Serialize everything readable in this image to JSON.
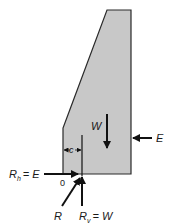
{
  "diagram": {
    "type": "gravity-wall-free-body",
    "colors": {
      "wall_fill": "#c8c8c8",
      "outline": "#2a2a2a",
      "arrow": "#111111",
      "background": "#ffffff"
    },
    "labels": {
      "weight": "W",
      "earth_pressure": "E",
      "eccentricity": "c",
      "origin": "0",
      "resultant": "R",
      "horizontal_reaction_main": "R",
      "horizontal_reaction_sub": "h",
      "horizontal_reaction_eq": "= E",
      "vertical_reaction_main": "R",
      "vertical_reaction_sub": "v",
      "vertical_reaction_eq": "= W"
    }
  }
}
